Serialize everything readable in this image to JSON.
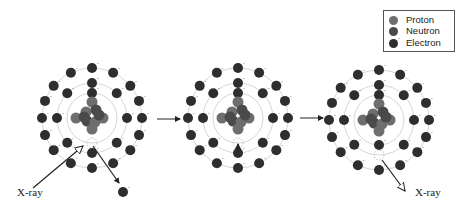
{
  "diagram": {
    "colors": {
      "proton": "#6e6e6e",
      "neutron": "#4a4a4a",
      "electron": "#2e2e2e",
      "shell": "#d6d6d6",
      "arrow": "#222222"
    },
    "legend": {
      "items": [
        {
          "label": "Proton",
          "type": "proton"
        },
        {
          "label": "Neutron",
          "type": "neutron"
        },
        {
          "label": "Electron",
          "type": "electron",
          "charge": "-"
        }
      ]
    },
    "labels": {
      "xray_in": "X-ray",
      "xray_out": "X-ray"
    },
    "atoms": [
      {
        "name": "atom-initial",
        "cx": 92,
        "cy": 118,
        "state": "incident X-ray ejects K-shell electron"
      },
      {
        "name": "atom-transition",
        "cx": 238,
        "cy": 118,
        "state": "L-shell electron fills K-shell vacancy"
      },
      {
        "name": "atom-emission",
        "cx": 379,
        "cy": 120,
        "state": "characteristic X-ray emitted"
      }
    ],
    "stages": [
      "Incident X-ray ejects inner electron",
      "Outer electron drops into vacancy",
      "Characteristic X-ray emitted"
    ]
  }
}
